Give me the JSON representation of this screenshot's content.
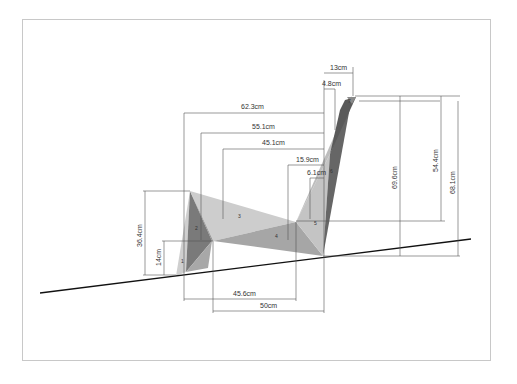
{
  "drawing": {
    "type": "dimensioned technical drawing",
    "subject": "folded panel chair/lounger on inclined ground",
    "panel_labels": [
      "1",
      "2",
      "3",
      "4",
      "5",
      "6",
      "7"
    ],
    "dimensions": {
      "horizontal": {
        "d_62_3": "62.3cm",
        "d_55_1": "55.1cm",
        "d_45_1": "45.1cm",
        "d_15_9": "15.9cm",
        "d_6_1": "6.1cm",
        "d_13": "13cm",
        "d_4_8": "4.8cm",
        "d_45_6": "45.6cm",
        "d_50": "50cm"
      },
      "vertical": {
        "d_36_4": "36.4cm",
        "d_14": "14cm",
        "d_69_6": "69.6cm",
        "d_54_4": "54.4cm",
        "d_68_1": "68.1cm"
      }
    },
    "colors": {
      "frame": "#c8c8c8",
      "ground_line": "#111111",
      "dim_line": "#555555",
      "panel_light": "#c8c8c8",
      "panel_mid": "#a9a9a9",
      "panel_dark": "#6e6e6e",
      "panel_darkest": "#555555"
    }
  }
}
